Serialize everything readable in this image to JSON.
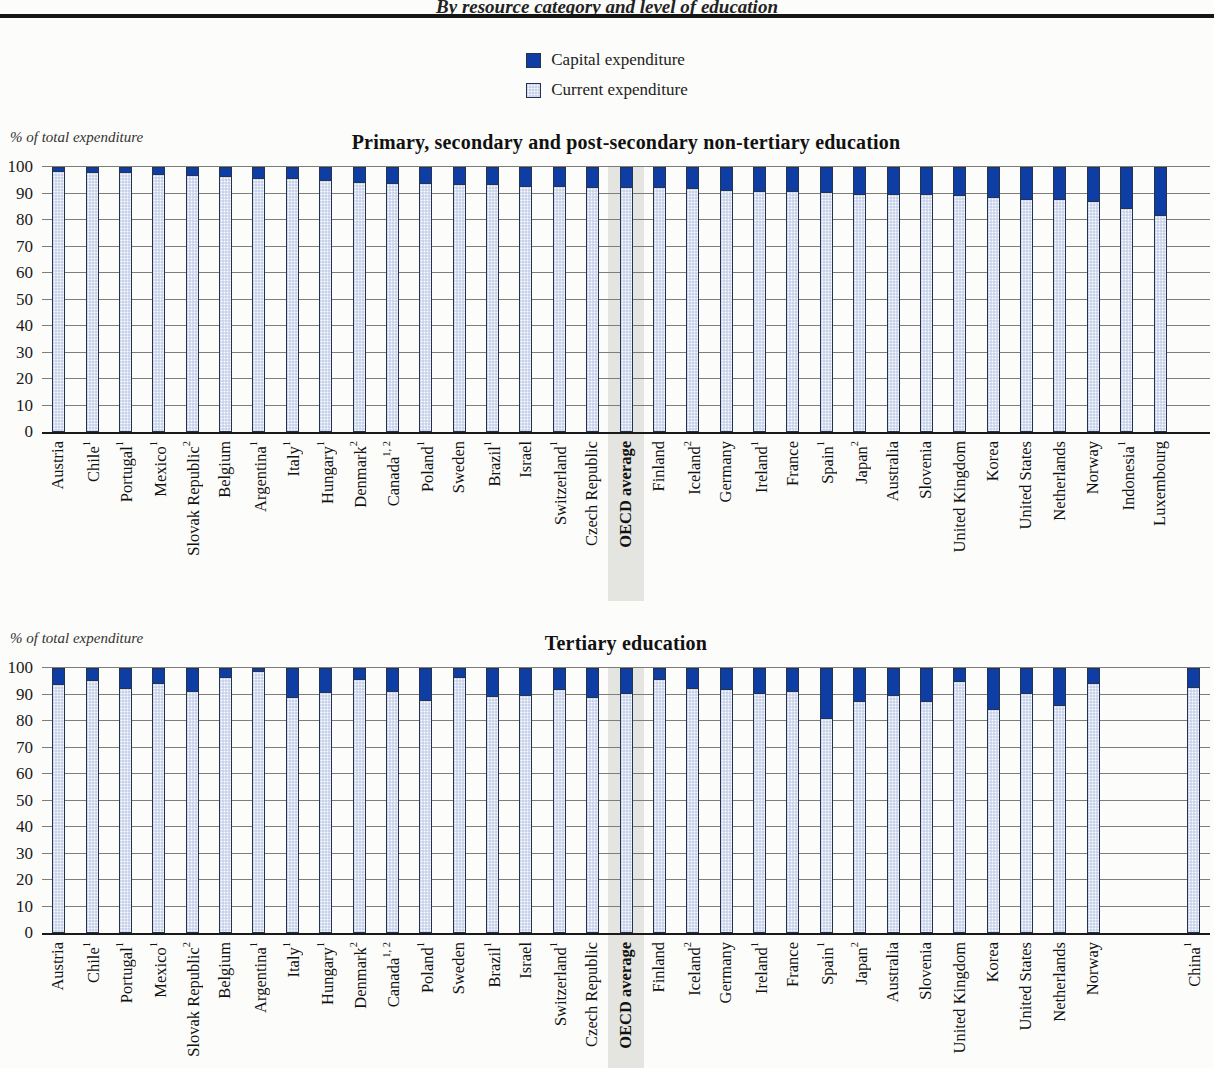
{
  "page": {
    "subtitle": "By resource category and level of education"
  },
  "legend": {
    "position": "top-center",
    "items": [
      {
        "label": "Capital expenditure",
        "color": "#0e3ea3",
        "pattern": "solid"
      },
      {
        "label": "Current expenditure",
        "color": "#c9d4ea",
        "pattern": "dots"
      }
    ]
  },
  "colors": {
    "capital": "#0e3ea3",
    "current": "#c9d4ea",
    "bar_border": "#26334f",
    "grid": "#7d7d7a",
    "axis": "#1a1a1a",
    "highlight_band": "#e4e4e0",
    "background": "#fcfcfa"
  },
  "chart_data": [
    {
      "type": "bar",
      "stacked": true,
      "units": "percent",
      "title": "Primary, secondary and post-secondary non-tertiary education",
      "ylabel": "% of total expenditure",
      "ylim": [
        0,
        100
      ],
      "yticks": [
        0,
        10,
        20,
        30,
        40,
        50,
        60,
        70,
        80,
        90,
        100
      ],
      "grid": true,
      "x_labels_rotated": true,
      "highlight_category": "OECD average",
      "categories": [
        {
          "name": "Austria",
          "sup": ""
        },
        {
          "name": "Chile",
          "sup": "1"
        },
        {
          "name": "Portugal",
          "sup": "1"
        },
        {
          "name": "Mexico",
          "sup": "1"
        },
        {
          "name": "Slovak Republic",
          "sup": "2"
        },
        {
          "name": "Belgium",
          "sup": ""
        },
        {
          "name": "Argentina",
          "sup": "1"
        },
        {
          "name": "Italy",
          "sup": "1"
        },
        {
          "name": "Hungary",
          "sup": "1"
        },
        {
          "name": "Denmark",
          "sup": "2"
        },
        {
          "name": "Canada",
          "sup": "1, 2"
        },
        {
          "name": "Poland",
          "sup": "1"
        },
        {
          "name": "Sweden",
          "sup": ""
        },
        {
          "name": "Brazil",
          "sup": "1"
        },
        {
          "name": "Israel",
          "sup": ""
        },
        {
          "name": "Switzerland",
          "sup": "1"
        },
        {
          "name": "Czech Republic",
          "sup": ""
        },
        {
          "name": "OECD average",
          "sup": "",
          "bold": true,
          "highlight": true
        },
        {
          "name": "Finland",
          "sup": ""
        },
        {
          "name": "Iceland",
          "sup": "2"
        },
        {
          "name": "Germany",
          "sup": ""
        },
        {
          "name": "Ireland",
          "sup": "1"
        },
        {
          "name": "France",
          "sup": ""
        },
        {
          "name": "Spain",
          "sup": "1"
        },
        {
          "name": "Japan",
          "sup": "2"
        },
        {
          "name": "Australia",
          "sup": ""
        },
        {
          "name": "Slovenia",
          "sup": ""
        },
        {
          "name": "United Kingdom",
          "sup": ""
        },
        {
          "name": "Korea",
          "sup": ""
        },
        {
          "name": "United States",
          "sup": ""
        },
        {
          "name": "Netherlands",
          "sup": ""
        },
        {
          "name": "Norway",
          "sup": ""
        },
        {
          "name": "Indonesia",
          "sup": "1"
        },
        {
          "name": "Luxembourg",
          "sup": ""
        },
        {
          "name": "",
          "sup": ""
        }
      ],
      "series": [
        {
          "name": "Capital expenditure",
          "values": [
            1.5,
            2,
            2,
            2.5,
            3,
            3.5,
            4,
            4,
            5,
            5.5,
            6,
            6,
            6.5,
            6.5,
            7,
            7,
            7.5,
            7.5,
            7.5,
            8,
            8.5,
            9,
            9,
            9.5,
            10,
            10,
            10,
            10.5,
            11.5,
            12,
            12,
            13,
            15.5,
            18,
            null
          ]
        },
        {
          "name": "Current expenditure",
          "values": [
            98.5,
            98,
            98,
            97.5,
            97,
            96.5,
            96,
            96,
            95,
            94.5,
            94,
            94,
            93.5,
            93.5,
            93,
            93,
            92.5,
            92.5,
            92.5,
            92,
            91.5,
            91,
            91,
            90.5,
            90,
            90,
            90,
            89.5,
            88.5,
            88,
            88,
            87,
            84.5,
            82,
            null
          ]
        }
      ]
    },
    {
      "type": "bar",
      "stacked": true,
      "units": "percent",
      "title": "Tertiary education",
      "ylabel": "% of total expenditure",
      "ylim": [
        0,
        100
      ],
      "yticks": [
        0,
        10,
        20,
        30,
        40,
        50,
        60,
        70,
        80,
        90,
        100
      ],
      "grid": true,
      "x_labels_rotated": true,
      "highlight_category": "OECD average",
      "categories": [
        {
          "name": "Austria",
          "sup": ""
        },
        {
          "name": "Chile",
          "sup": "1"
        },
        {
          "name": "Portugal",
          "sup": "1"
        },
        {
          "name": "Mexico",
          "sup": "1"
        },
        {
          "name": "Slovak Republic",
          "sup": "2"
        },
        {
          "name": "Belgium",
          "sup": ""
        },
        {
          "name": "Argentina",
          "sup": "1"
        },
        {
          "name": "Italy",
          "sup": "1"
        },
        {
          "name": "Hungary",
          "sup": "1"
        },
        {
          "name": "Denmark",
          "sup": "2"
        },
        {
          "name": "Canada",
          "sup": "1, 2"
        },
        {
          "name": "Poland",
          "sup": "1"
        },
        {
          "name": "Sweden",
          "sup": ""
        },
        {
          "name": "Brazil",
          "sup": "1"
        },
        {
          "name": "Israel",
          "sup": ""
        },
        {
          "name": "Switzerland",
          "sup": "1"
        },
        {
          "name": "Czech Republic",
          "sup": ""
        },
        {
          "name": "OECD average",
          "sup": "",
          "bold": true,
          "highlight": true
        },
        {
          "name": "Finland",
          "sup": ""
        },
        {
          "name": "Iceland",
          "sup": "2"
        },
        {
          "name": "Germany",
          "sup": ""
        },
        {
          "name": "Ireland",
          "sup": "1"
        },
        {
          "name": "France",
          "sup": ""
        },
        {
          "name": "Spain",
          "sup": "1"
        },
        {
          "name": "Japan",
          "sup": "2"
        },
        {
          "name": "Australia",
          "sup": ""
        },
        {
          "name": "Slovenia",
          "sup": ""
        },
        {
          "name": "United Kingdom",
          "sup": ""
        },
        {
          "name": "Korea",
          "sup": ""
        },
        {
          "name": "United States",
          "sup": ""
        },
        {
          "name": "Netherlands",
          "sup": ""
        },
        {
          "name": "Norway",
          "sup": ""
        },
        {
          "name": "",
          "sup": ""
        },
        {
          "name": "",
          "sup": ""
        },
        {
          "name": "China",
          "sup": "1"
        }
      ],
      "series": [
        {
          "name": "Capital expenditure",
          "values": [
            6,
            4.5,
            7.5,
            5.5,
            8.5,
            3.5,
            1,
            11,
            9,
            4,
            8.5,
            12,
            3.5,
            10.5,
            10,
            8,
            11,
            9.5,
            4,
            7.5,
            8,
            9.5,
            8.5,
            19,
            12.5,
            10,
            12.5,
            5,
            15.5,
            9.5,
            14,
            5.5,
            null,
            null,
            7
          ]
        },
        {
          "name": "Current expenditure",
          "values": [
            94,
            95.5,
            92.5,
            94.5,
            91.5,
            96.5,
            99,
            89,
            91,
            96,
            91.5,
            88,
            96.5,
            89.5,
            90,
            92,
            89,
            90.5,
            96,
            92.5,
            92,
            90.5,
            91.5,
            81,
            87.5,
            90,
            87.5,
            95,
            84.5,
            90.5,
            86,
            94.5,
            null,
            null,
            93
          ]
        }
      ]
    }
  ]
}
